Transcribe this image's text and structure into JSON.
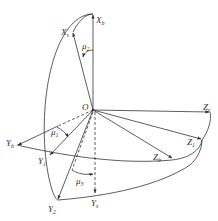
{
  "diagram": {
    "origin": {
      "label": "O"
    },
    "labels": {
      "Xb": {
        "main": "X",
        "sub": "b"
      },
      "Xs": {
        "main": "X",
        "sub": "s"
      },
      "mu2": {
        "main": "μ",
        "sub": "2"
      },
      "Zs": {
        "main": "Z",
        "sub": "s"
      },
      "Yb": {
        "main": "Y",
        "sub": "b"
      },
      "mu1": {
        "main": "μ",
        "sub": "1"
      },
      "Y1": {
        "main": "Y",
        "sub": "1"
      },
      "Z1": {
        "main": "Z",
        "sub": "1"
      },
      "Zb": {
        "main": "Z",
        "sub": "b"
      },
      "mu3": {
        "main": "μ",
        "sub": "3"
      },
      "Y2": {
        "main": "Y",
        "sub": "2"
      },
      "Ys": {
        "main": "Y",
        "sub": "s"
      }
    },
    "colors": {
      "stroke": "#333333",
      "background": "#ffffff"
    }
  }
}
